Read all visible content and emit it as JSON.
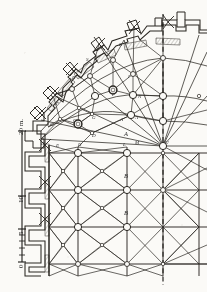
{
  "plate": {
    "title": "Cathedral apse and choir vault plan",
    "description": "Half plan of a Gothic chevet: radiating rib vault over the apse, rectangular ribbed bays of the choir, buttressed perimeter wall with pinnacles, dashed axis of symmetry at right.",
    "ink_color": "#2a2722",
    "paper_color": "#fbfaf7",
    "axis_style": "dashed"
  },
  "scale_bar": {
    "unit_label": "20 m.",
    "ticks": [
      {
        "label": "20",
        "value": 20
      },
      {
        "label": "10",
        "value": 10
      },
      {
        "label": "5",
        "value": 5
      },
      {
        "label": "0",
        "value": 0
      }
    ],
    "minor_divisions": 5
  },
  "vault_labels": [
    {
      "id": "K",
      "text": "K",
      "x": 119,
      "y": 42
    },
    {
      "id": "S",
      "text": "S",
      "x": 86,
      "y": 57
    },
    {
      "id": "R",
      "text": "R",
      "x": 72,
      "y": 75
    },
    {
      "id": "F",
      "text": "F",
      "x": 56,
      "y": 101
    },
    {
      "id": "G_outer",
      "text": "G",
      "x": 50,
      "y": 122
    },
    {
      "id": "P",
      "text": "P",
      "x": 112,
      "y": 92
    },
    {
      "id": "N",
      "text": "N",
      "x": 138,
      "y": 94
    },
    {
      "id": "I",
      "text": "I",
      "x": 128,
      "y": 74
    },
    {
      "id": "G_inner",
      "text": "G",
      "x": 92,
      "y": 115
    },
    {
      "id": "O",
      "text": "O",
      "x": 73,
      "y": 118
    },
    {
      "id": "A_prime",
      "text": "A'",
      "x": 120,
      "y": 117
    },
    {
      "id": "A_node",
      "text": "A",
      "x": 135,
      "y": 115
    },
    {
      "id": "D",
      "text": "D",
      "x": 92,
      "y": 133
    },
    {
      "id": "D_wall",
      "text": "D",
      "x": 41,
      "y": 141
    },
    {
      "id": "E",
      "text": "E",
      "x": 56,
      "y": 143
    },
    {
      "id": "H",
      "text": "H",
      "x": 78,
      "y": 142
    },
    {
      "id": "L",
      "text": "L",
      "x": 123,
      "y": 142
    },
    {
      "id": "M",
      "text": "M",
      "x": 135,
      "y": 140
    },
    {
      "id": "U",
      "text": "U",
      "x": 165,
      "y": 140
    }
  ],
  "bay_labels": [
    {
      "id": "bayA",
      "text": "A",
      "x": 124,
      "y": 131
    },
    {
      "id": "bayB1",
      "text": "B",
      "x": 124,
      "y": 173
    },
    {
      "id": "bayB2",
      "text": "B",
      "x": 124,
      "y": 210
    }
  ],
  "geometry": {
    "axis_x": 163,
    "choir_top_y": 153,
    "bay_pitch_x": 36,
    "bay_pitch_y": 37,
    "boss_radius_large": 3.6,
    "boss_radius_small": 1.7,
    "apse_center": {
      "x": 163,
      "y": 146
    }
  }
}
